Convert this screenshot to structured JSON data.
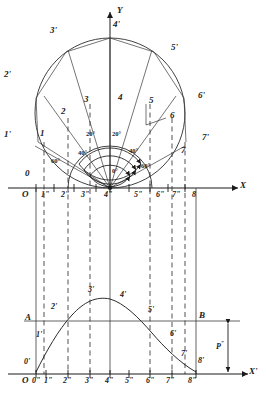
{
  "figure": {
    "axes": {
      "upper_y_label": "Y",
      "upper_x_label": "X",
      "lower_x_label": "X'",
      "upper_origin": "O",
      "lower_origin": "O"
    },
    "upper_x_ticks": [
      "1\"",
      "2\"",
      "3\"",
      "4\"",
      "5\"",
      "6\"",
      "7\"",
      "8"
    ],
    "lower_x_ticks": [
      "0\"",
      "1\"",
      "2\"",
      "3\"",
      "4\"",
      "5\"",
      "6\"",
      "7\"",
      "8\""
    ],
    "outer_circle_points": [
      "0'",
      "1'",
      "2'",
      "3'",
      "4'",
      "5'",
      "6'",
      "7'"
    ],
    "inner_arc_points": [
      "1",
      "2",
      "3",
      "4",
      "5",
      "6",
      "7"
    ],
    "curve_points": [
      "0'",
      "1'",
      "2'",
      "3'",
      "4'",
      "5'",
      "6'",
      "7'",
      "8'"
    ],
    "angles": {
      "zero": "0°",
      "left_20": "20°",
      "right_20": "20°",
      "left_40": "40°",
      "right_40": "40°",
      "left_60": "60°",
      "right_60": "60°"
    },
    "chord_line_labels": {
      "left": "A",
      "right": "B"
    },
    "amplitude_label": "P",
    "amplitude_label_sup": "″",
    "origin_upper_marker": "0",
    "origin_lower_marker": "0'",
    "end_lower_marker": "8'",
    "colors": {
      "ink": "#1a1a1a",
      "thin": "#3a3a3a",
      "dash": "#333333",
      "background": "#ffffff"
    }
  }
}
